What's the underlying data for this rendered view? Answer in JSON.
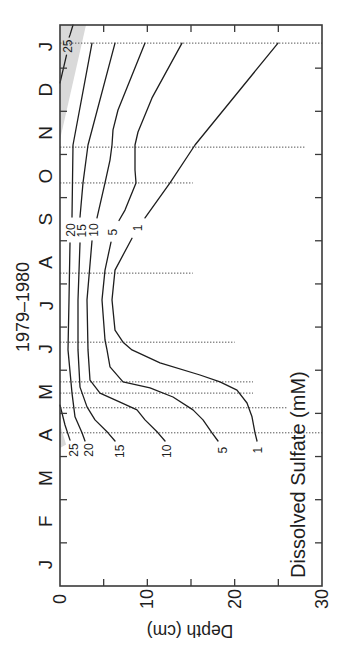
{
  "chart_data": {
    "type": "line",
    "variant": "contour",
    "title": "1979–1980",
    "xlabel": "Depth (cm)",
    "ylabel": "",
    "annotation": "Dissolved Sulfate (mM)",
    "orientation": "rotated 90° counter-clockwise: time runs bottom→top, depth runs left→right",
    "grid": false,
    "legend": null,
    "colors": {
      "contour": "#1e1e1e",
      "sampling_line": "#555555",
      "shade": "#d9d9d9",
      "axis": "#3a3a3a",
      "text": "#1e1e1e"
    },
    "time_axis": {
      "tick_labels": [
        "J",
        "F",
        "M",
        "A",
        "M",
        "J",
        "J",
        "A",
        "S",
        "O",
        "N",
        "D",
        "J"
      ],
      "range_months": [
        0,
        13
      ],
      "unit": "months from start of January 1979"
    },
    "depth_axis": {
      "tick_labels": [
        "0",
        "10",
        "20",
        "30"
      ],
      "ticks": [
        0,
        10,
        20,
        30
      ],
      "minor_ticks": [
        5,
        15,
        25
      ],
      "range": [
        0,
        30
      ],
      "unit": "cm"
    },
    "point_format": "[month, depth_cm]",
    "series": [
      {
        "name": "1 mM",
        "level": 1,
        "label": "1",
        "segments": [
          [
            [
              12.58,
              24.96
            ],
            [
              10.22,
              15.46
            ],
            [
              9.34,
              12.6
            ],
            [
              8.53,
              9.73
            ]
          ],
          [
            [
              8.06,
              8.24
            ],
            [
              7.32,
              6.3
            ],
            [
              6.63,
              5.95
            ],
            [
              5.93,
              6.3
            ],
            [
              5.65,
              7.21
            ],
            [
              5.47,
              8.24
            ],
            [
              5.17,
              11.45
            ],
            [
              4.89,
              16.03
            ],
            [
              4.73,
              18.32
            ],
            [
              4.54,
              20.27
            ],
            [
              4.24,
              21.41
            ],
            [
              3.92,
              21.99
            ],
            [
              3.55,
              22.33
            ],
            [
              3.36,
              22.56
            ]
          ]
        ],
        "label_positions": [
          [
            8.3,
            8.93
          ],
          [
            3.15,
            22.67
          ]
        ]
      },
      {
        "name": "5 mM",
        "level": 5,
        "label": "5",
        "segments": [
          [
            [
              12.58,
              13.97
            ],
            [
              11.31,
              10.53
            ],
            [
              10.52,
              8.93
            ],
            [
              10.22,
              8.59
            ],
            [
              9.64,
              8.59
            ],
            [
              9.34,
              8.7
            ],
            [
              8.71,
              7.44
            ],
            [
              8.47,
              6.76
            ]
          ],
          [
            [
              7.97,
              5.84
            ],
            [
              7.32,
              5.15
            ],
            [
              6.63,
              4.81
            ],
            [
              5.7,
              5.15
            ],
            [
              5.47,
              5.38
            ],
            [
              5.08,
              5.73
            ],
            [
              4.73,
              7.21
            ],
            [
              4.59,
              10.31
            ],
            [
              4.38,
              12.94
            ],
            [
              4.08,
              15.23
            ],
            [
              3.85,
              16.37
            ],
            [
              3.55,
              17.41
            ],
            [
              3.36,
              18.09
            ]
          ]
        ],
        "label_positions": [
          [
            8.2,
            6.07
          ],
          [
            3.15,
            18.66
          ]
        ]
      },
      {
        "name": "10 mM",
        "level": 10,
        "label": "10",
        "segments": [
          [
            [
              12.58,
              9.73
            ],
            [
              11.03,
              6.64
            ],
            [
              10.57,
              6.07
            ],
            [
              10.22,
              5.95
            ],
            [
              9.87,
              5.73
            ],
            [
              9.34,
              5.15
            ],
            [
              8.53,
              4.24
            ]
          ],
          [
            [
              8.0,
              3.66
            ],
            [
              6.63,
              3.09
            ],
            [
              5.47,
              3.21
            ],
            [
              4.77,
              3.44
            ],
            [
              4.47,
              4.58
            ],
            [
              4.26,
              6.87
            ],
            [
              4.08,
              8.82
            ],
            [
              3.85,
              9.73
            ],
            [
              3.55,
              11.22
            ],
            [
              3.36,
              12.02
            ]
          ]
        ],
        "label_positions": [
          [
            8.25,
            3.89
          ],
          [
            3.12,
            12.25
          ]
        ]
      },
      {
        "name": "15 mM",
        "level": 15,
        "label": "15",
        "segments": [
          [
            [
              12.58,
              6.3
            ],
            [
              10.22,
              3.21
            ],
            [
              9.34,
              2.63
            ],
            [
              8.55,
              2.29
            ]
          ],
          [
            [
              7.95,
              2.29
            ],
            [
              6.63,
              2.06
            ],
            [
              5.47,
              2.06
            ],
            [
              4.61,
              2.29
            ],
            [
              4.15,
              3.09
            ],
            [
              3.85,
              4.01
            ],
            [
              3.55,
              5.5
            ],
            [
              3.36,
              6.3
            ]
          ]
        ],
        "label_positions": [
          [
            8.23,
            2.52
          ],
          [
            3.12,
            6.87
          ]
        ]
      },
      {
        "name": "20 mM",
        "level": 20,
        "label": "20",
        "segments": [
          [
            [
              12.58,
              3.66
            ],
            [
              10.22,
              1.49
            ],
            [
              8.55,
              1.37
            ]
          ],
          [
            [
              7.95,
              1.15
            ],
            [
              6.63,
              1.03
            ],
            [
              5.47,
              0.92
            ],
            [
              4.47,
              1.37
            ],
            [
              3.92,
              1.72
            ],
            [
              3.55,
              2.52
            ],
            [
              3.36,
              2.86
            ]
          ]
        ],
        "label_positions": [
          [
            8.25,
            1.26
          ],
          [
            3.15,
            3.32
          ]
        ]
      },
      {
        "name": "25 mM",
        "level": 25,
        "label": "25",
        "segments": [
          [
            [
              13.0,
              1.49
            ],
            [
              12.77,
              1.15
            ],
            [
              12.72,
              1.05
            ]
          ],
          [
            [
              12.3,
              0.75
            ],
            [
              11.66,
              0.0
            ]
          ],
          [
            [
              4.19,
              0.0
            ],
            [
              3.73,
              0.57
            ],
            [
              3.38,
              1.15
            ]
          ]
        ],
        "label_positions": [
          [
            12.51,
            0.92
          ],
          [
            3.15,
            1.6
          ]
        ]
      }
    ],
    "shaded_region": {
      "name": "sulfate > 25 mM",
      "polygons": [
        [
          [
            13.0,
            0.0
          ],
          [
            13.0,
            2.98
          ],
          [
            10.34,
            0.0
          ]
        ],
        [
          [
            3.75,
            0.0
          ],
          [
            3.28,
            0.7
          ],
          [
            3.2,
            0.0
          ]
        ]
      ]
    },
    "sampling_dates": [
      {
        "month": 12.58,
        "max_depth": 30.0
      },
      {
        "month": 10.17,
        "max_depth": 28.1
      },
      {
        "month": 9.34,
        "max_depth": 15.2
      },
      {
        "month": 7.25,
        "max_depth": 15.2
      },
      {
        "month": 5.65,
        "max_depth": 20.0
      },
      {
        "month": 4.73,
        "max_depth": 22.1
      },
      {
        "month": 4.47,
        "max_depth": 22.1
      },
      {
        "month": 4.13,
        "max_depth": 26.1
      },
      {
        "month": 3.55,
        "max_depth": 30.0
      }
    ]
  }
}
